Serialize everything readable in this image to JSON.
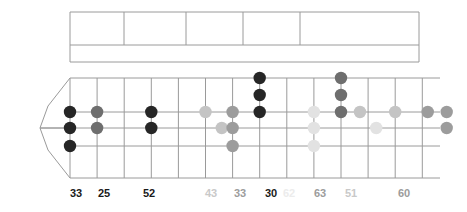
{
  "diagram": {
    "type": "guitar-fretboard-grid",
    "geometry": {
      "board_left": 70,
      "board_right": 440,
      "column_step": 27.1,
      "columns": 14,
      "main_top": 78,
      "main_bottom": 178,
      "string_rows": [
        78,
        112,
        128,
        146,
        178
      ],
      "upper_band_top": 12,
      "upper_band_mid": 45,
      "upper_band_bottom": 62
    },
    "colors": {
      "grid": "#9a9a9a",
      "dot_black": "#262626",
      "dot_dark_gray": "#6e6e6e",
      "dot_mid_gray": "#9c9c9c",
      "dot_light_gray": "#c4c4c4",
      "dot_faint_gray": "#e2e2e2",
      "label_dark": "#1a1a1a",
      "label_mid": "#9c9c9c",
      "label_light": "#c9c9c9",
      "label_faint": "#ececec",
      "background": "#ffffff"
    },
    "upper_band": {
      "x_start": 70,
      "x_end": 419,
      "divider_x": [
        70,
        124,
        186,
        243,
        300,
        419
      ],
      "row_divider_y": 45
    },
    "dots": [
      {
        "col": 0,
        "row": 112,
        "shade": "dot_black"
      },
      {
        "col": 0,
        "row": 128,
        "shade": "dot_black"
      },
      {
        "col": 0,
        "row": 146,
        "shade": "dot_black"
      },
      {
        "col": 1,
        "row": 112,
        "shade": "dot_dark_gray"
      },
      {
        "col": 1,
        "row": 128,
        "shade": "dot_dark_gray"
      },
      {
        "col": 3,
        "row": 112,
        "shade": "dot_black"
      },
      {
        "col": 3,
        "row": 128,
        "shade": "dot_black"
      },
      {
        "col": 5,
        "row": 112,
        "shade": "dot_light_gray"
      },
      {
        "col": 5.6,
        "row": 128,
        "shade": "dot_light_gray"
      },
      {
        "col": 6,
        "row": 112,
        "shade": "dot_mid_gray"
      },
      {
        "col": 6,
        "row": 128,
        "shade": "dot_mid_gray"
      },
      {
        "col": 6,
        "row": 146,
        "shade": "dot_mid_gray"
      },
      {
        "col": 7,
        "row": 78,
        "shade": "dot_black"
      },
      {
        "col": 7,
        "row": 95,
        "shade": "dot_black"
      },
      {
        "col": 7,
        "row": 112,
        "shade": "dot_black"
      },
      {
        "col": 9,
        "row": 112,
        "shade": "dot_faint_gray"
      },
      {
        "col": 9,
        "row": 128,
        "shade": "dot_faint_gray"
      },
      {
        "col": 9,
        "row": 146,
        "shade": "dot_faint_gray"
      },
      {
        "col": 10,
        "row": 78,
        "shade": "dot_dark_gray"
      },
      {
        "col": 10,
        "row": 95,
        "shade": "dot_dark_gray"
      },
      {
        "col": 10,
        "row": 112,
        "shade": "dot_dark_gray"
      },
      {
        "col": 10.7,
        "row": 112,
        "shade": "dot_light_gray"
      },
      {
        "col": 11.3,
        "row": 128,
        "shade": "dot_faint_gray"
      },
      {
        "col": 12,
        "row": 112,
        "shade": "dot_light_gray"
      },
      {
        "col": 13.2,
        "row": 112,
        "shade": "dot_mid_gray"
      },
      {
        "col": 13.9,
        "row": 112,
        "shade": "dot_mid_gray"
      },
      {
        "col": 13.9,
        "row": 128,
        "shade": "dot_mid_gray"
      }
    ],
    "labels": [
      {
        "text": "33",
        "x": 76,
        "tone": "label_dark"
      },
      {
        "text": "25",
        "x": 104,
        "tone": "label_dark"
      },
      {
        "text": "52",
        "x": 149,
        "tone": "label_dark"
      },
      {
        "text": "43",
        "x": 211,
        "tone": "label_light"
      },
      {
        "text": "33",
        "x": 240,
        "tone": "label_mid"
      },
      {
        "text": "30",
        "x": 271,
        "tone": "label_dark"
      },
      {
        "text": "62",
        "x": 289,
        "tone": "label_faint"
      },
      {
        "text": "63",
        "x": 320,
        "tone": "label_mid"
      },
      {
        "text": "51",
        "x": 351,
        "tone": "label_light"
      },
      {
        "text": "60",
        "x": 404,
        "tone": "label_mid"
      }
    ]
  }
}
